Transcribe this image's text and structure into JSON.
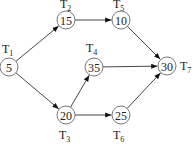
{
  "diagram": {
    "type": "task-dependency-graph",
    "nodes": [
      {
        "id": "T1",
        "label": "T",
        "sub": "1",
        "value": "5",
        "x": 9,
        "y": 67,
        "lx": 2,
        "ly": 53
      },
      {
        "id": "T2",
        "label": "T",
        "sub": "2",
        "value": "15",
        "x": 66,
        "y": 20,
        "lx": 60,
        "ly": 8
      },
      {
        "id": "T3",
        "label": "T",
        "sub": "3",
        "value": "20",
        "x": 66,
        "y": 115,
        "lx": 59,
        "ly": 139
      },
      {
        "id": "T4",
        "label": "T",
        "sub": "4",
        "value": "35",
        "x": 94,
        "y": 67,
        "lx": 86,
        "ly": 52
      },
      {
        "id": "T5",
        "label": "T",
        "sub": "5",
        "value": "10",
        "x": 121,
        "y": 20,
        "lx": 113,
        "ly": 8
      },
      {
        "id": "T6",
        "label": "T",
        "sub": "6",
        "value": "25",
        "x": 121,
        "y": 115,
        "lx": 113,
        "ly": 139
      },
      {
        "id": "T7",
        "label": "T",
        "sub": "7",
        "value": "30",
        "x": 167,
        "y": 66,
        "lx": 180,
        "ly": 70
      }
    ],
    "edges": [
      {
        "from": "T1",
        "to": "T2"
      },
      {
        "from": "T1",
        "to": "T3"
      },
      {
        "from": "T2",
        "to": "T5"
      },
      {
        "from": "T3",
        "to": "T4"
      },
      {
        "from": "T3",
        "to": "T6"
      },
      {
        "from": "T4",
        "to": "T7"
      },
      {
        "from": "T5",
        "to": "T7"
      },
      {
        "from": "T6",
        "to": "T7"
      }
    ]
  }
}
